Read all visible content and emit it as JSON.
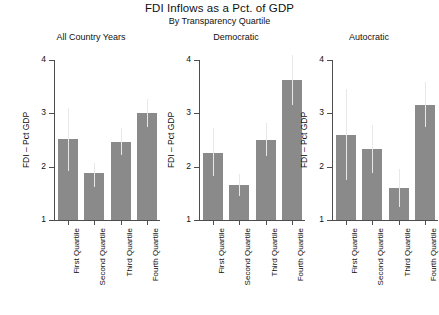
{
  "chart_data": {
    "type": "bar",
    "title": "FDI Inflows as a Pct. of GDP",
    "subtitle": "By Transparency Quartile",
    "ylabel": "FDI – Pct GDP",
    "xlabel": "",
    "ylim": [
      1,
      4
    ],
    "yticks": [
      1,
      2,
      3,
      4
    ],
    "ytick_labels": [
      "1",
      "2",
      "3",
      "4"
    ],
    "grid": false,
    "legend": "none",
    "categories": [
      "First Quartile",
      "Second Quartile",
      "Third Quartile",
      "Fourth Quartile"
    ],
    "bar_color": "#8a8a8a",
    "errorbar_color": "#e8e8e8",
    "panels": [
      {
        "name": "All Country Years",
        "values": [
          2.52,
          1.88,
          2.46,
          3.01
        ],
        "err_low": [
          1.92,
          1.62,
          2.22,
          2.74
        ],
        "err_high": [
          3.1,
          2.06,
          2.73,
          3.27
        ]
      },
      {
        "name": "Democratic",
        "values": [
          2.25,
          1.65,
          2.5,
          3.63
        ],
        "err_low": [
          1.82,
          1.45,
          2.2,
          3.16
        ],
        "err_high": [
          2.72,
          1.86,
          2.82,
          4.1
        ]
      },
      {
        "name": "Autocratic",
        "values": [
          2.6,
          2.33,
          1.6,
          3.15
        ],
        "err_low": [
          1.75,
          1.88,
          1.25,
          2.74
        ],
        "err_high": [
          3.45,
          2.78,
          1.96,
          3.58
        ]
      }
    ]
  }
}
